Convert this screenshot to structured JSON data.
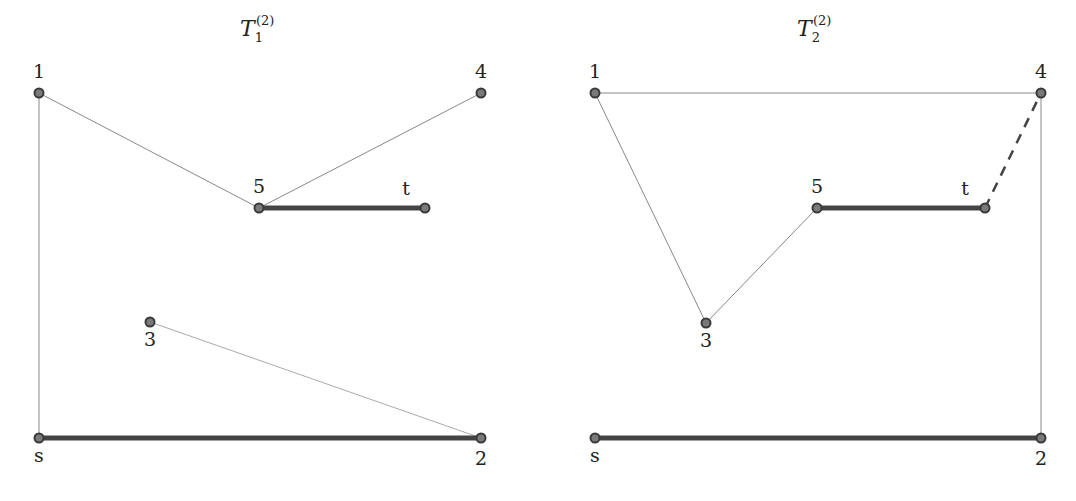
{
  "diagrams": [
    {
      "title": {
        "base": "T",
        "sub": "1",
        "sup": "(2)"
      },
      "nodes": [
        {
          "id": "1",
          "label": "1",
          "x": 39,
          "y": 93,
          "lx": 39,
          "ly": 78
        },
        {
          "id": "4",
          "label": "4",
          "x": 481,
          "y": 93,
          "lx": 481,
          "ly": 78
        },
        {
          "id": "5",
          "label": "5",
          "x": 259,
          "y": 208,
          "lx": 259,
          "ly": 193
        },
        {
          "id": "t",
          "label": "t",
          "x": 425,
          "y": 208,
          "lx": 406,
          "ly": 195
        },
        {
          "id": "3",
          "label": "3",
          "x": 150,
          "y": 322,
          "lx": 150,
          "ly": 346
        },
        {
          "id": "s",
          "label": "s",
          "x": 39,
          "y": 438,
          "lx": 39,
          "ly": 462
        },
        {
          "id": "2",
          "label": "2",
          "x": 481,
          "y": 438,
          "lx": 481,
          "ly": 465
        }
      ],
      "edges": [
        {
          "from": "1",
          "to": "5",
          "style": "thin"
        },
        {
          "from": "5",
          "to": "4",
          "style": "thin"
        },
        {
          "from": "5",
          "to": "t",
          "style": "thick"
        },
        {
          "from": "1",
          "to": "s",
          "style": "thin"
        },
        {
          "from": "3",
          "to": "2",
          "style": "light"
        },
        {
          "from": "s",
          "to": "2",
          "style": "thick"
        }
      ]
    },
    {
      "title": {
        "base": "T",
        "sub": "2",
        "sup": "(2)"
      },
      "nodes": [
        {
          "id": "1",
          "label": "1",
          "x": 595,
          "y": 93,
          "lx": 595,
          "ly": 78
        },
        {
          "id": "4",
          "label": "4",
          "x": 1041,
          "y": 93,
          "lx": 1041,
          "ly": 78
        },
        {
          "id": "5",
          "label": "5",
          "x": 817,
          "y": 208,
          "lx": 817,
          "ly": 193
        },
        {
          "id": "t",
          "label": "t",
          "x": 985,
          "y": 208,
          "lx": 965,
          "ly": 195
        },
        {
          "id": "3",
          "label": "3",
          "x": 706,
          "y": 323,
          "lx": 706,
          "ly": 347
        },
        {
          "id": "s",
          "label": "s",
          "x": 595,
          "y": 438,
          "lx": 595,
          "ly": 462
        },
        {
          "id": "2",
          "label": "2",
          "x": 1041,
          "y": 438,
          "lx": 1041,
          "ly": 465
        }
      ],
      "edges": [
        {
          "from": "1",
          "to": "4",
          "style": "thin"
        },
        {
          "from": "1",
          "to": "3",
          "style": "thin"
        },
        {
          "from": "3",
          "to": "5",
          "style": "thin"
        },
        {
          "from": "5",
          "to": "t",
          "style": "thick"
        },
        {
          "from": "t",
          "to": "4",
          "style": "dashed"
        },
        {
          "from": "4",
          "to": "2",
          "style": "thin"
        },
        {
          "from": "s",
          "to": "2",
          "style": "thick"
        }
      ]
    }
  ],
  "title_positions": [
    {
      "x": 240,
      "y": 36
    },
    {
      "x": 797,
      "y": 36
    }
  ]
}
